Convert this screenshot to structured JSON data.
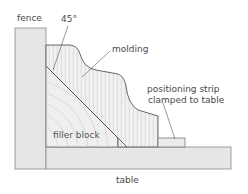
{
  "labels": {
    "fence": "fence",
    "angle": "45°",
    "molding": "molding",
    "strip_line1": "positioning strip",
    "strip_line2": "clamped to table",
    "filler": "filler block",
    "table": "table"
  },
  "colors": {
    "fence_fill": "#e6e6e6",
    "table_fill": "#e6e6e6",
    "wood_fill": "#efefef",
    "outline": "#555555",
    "grain": "#bdbdbd",
    "text": "#4a4a4a"
  }
}
